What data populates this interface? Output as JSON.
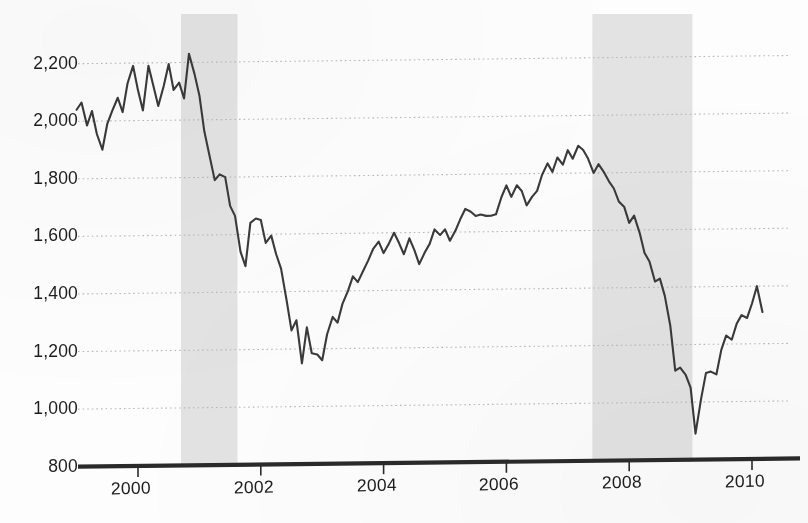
{
  "chart_data": {
    "type": "line",
    "title": "",
    "subtitle": "",
    "xlabel": "",
    "ylabel": "",
    "xlim": [
      1999.0,
      2010.3
    ],
    "ylim": [
      800,
      2300
    ],
    "grid": true,
    "grid_style": "dotted-horizontal",
    "legend": "none",
    "y_ticks": [
      800,
      1000,
      1200,
      1400,
      1600,
      1800,
      2000,
      2200
    ],
    "y_tick_labels": [
      "800",
      "1,000",
      "1,200",
      "1,400",
      "1,600",
      "1,800",
      "2,000",
      "2,200"
    ],
    "x_ticks": [
      2000,
      2002,
      2004,
      2006,
      2008,
      2010
    ],
    "x_tick_labels": [
      "2000",
      "2002",
      "2004",
      "2006",
      "2008",
      "2010"
    ],
    "colors": {
      "line": "#3a3a3a",
      "grid": "#b9b9b9",
      "axis": "#2a2a2a",
      "recession_band": "#e2e2e2",
      "background": "#fdfdfd",
      "text": "#1d1d1f"
    },
    "annotations": {
      "shaded_regions_label": "recession bands"
    },
    "shaded_regions": [
      {
        "name": "recession-band-2001",
        "x0": 2000.7,
        "x1": 2001.62
      },
      {
        "name": "recession-band-2008",
        "x0": 2007.4,
        "x1": 2009.03
      }
    ],
    "series": [
      {
        "name": "index-level",
        "x": [
          1999.0,
          1999.08,
          1999.17,
          1999.25,
          1999.33,
          1999.42,
          1999.5,
          1999.58,
          1999.67,
          1999.75,
          1999.83,
          1999.92,
          2000.0,
          2000.08,
          2000.17,
          2000.25,
          2000.33,
          2000.42,
          2000.5,
          2000.58,
          2000.67,
          2000.75,
          2000.83,
          2000.92,
          2001.0,
          2001.08,
          2001.17,
          2001.25,
          2001.33,
          2001.42,
          2001.5,
          2001.58,
          2001.67,
          2001.75,
          2001.83,
          2001.92,
          2002.0,
          2002.08,
          2002.17,
          2002.25,
          2002.33,
          2002.42,
          2002.5,
          2002.58,
          2002.67,
          2002.75,
          2002.83,
          2002.92,
          2003.0,
          2003.08,
          2003.17,
          2003.25,
          2003.33,
          2003.42,
          2003.5,
          2003.58,
          2003.67,
          2003.75,
          2003.83,
          2003.92,
          2004.0,
          2004.08,
          2004.17,
          2004.25,
          2004.33,
          2004.42,
          2004.5,
          2004.58,
          2004.67,
          2004.75,
          2004.83,
          2004.92,
          2005.0,
          2005.08,
          2005.17,
          2005.25,
          2005.33,
          2005.42,
          2005.5,
          2005.58,
          2005.67,
          2005.75,
          2005.83,
          2005.92,
          2006.0,
          2006.08,
          2006.17,
          2006.25,
          2006.33,
          2006.42,
          2006.5,
          2006.58,
          2006.67,
          2006.75,
          2006.83,
          2006.92,
          2007.0,
          2007.08,
          2007.17,
          2007.25,
          2007.33,
          2007.42,
          2007.5,
          2007.58,
          2007.67,
          2007.75,
          2007.83,
          2007.92,
          2008.0,
          2008.08,
          2008.17,
          2008.25,
          2008.33,
          2008.42,
          2008.5,
          2008.58,
          2008.67,
          2008.75,
          2008.83,
          2008.92,
          2009.0,
          2009.08,
          2009.17,
          2009.25,
          2009.33,
          2009.42,
          2009.5,
          2009.58,
          2009.67,
          2009.75,
          2009.83,
          2009.92,
          2010.0,
          2010.08,
          2010.17
        ],
        "values": [
          2040,
          2065,
          1985,
          2035,
          1955,
          1900,
          1990,
          2035,
          2080,
          2030,
          2130,
          2190,
          2105,
          2035,
          2190,
          2120,
          2050,
          2120,
          2195,
          2105,
          2130,
          2075,
          2230,
          2160,
          2085,
          1960,
          1870,
          1790,
          1810,
          1800,
          1700,
          1665,
          1540,
          1490,
          1640,
          1655,
          1650,
          1570,
          1595,
          1530,
          1480,
          1370,
          1265,
          1300,
          1150,
          1275,
          1185,
          1180,
          1160,
          1250,
          1310,
          1290,
          1355,
          1400,
          1450,
          1430,
          1470,
          1505,
          1545,
          1570,
          1530,
          1560,
          1600,
          1565,
          1525,
          1580,
          1540,
          1490,
          1530,
          1560,
          1610,
          1590,
          1610,
          1570,
          1605,
          1645,
          1680,
          1670,
          1655,
          1660,
          1655,
          1655,
          1660,
          1720,
          1760,
          1720,
          1760,
          1740,
          1690,
          1720,
          1740,
          1795,
          1835,
          1805,
          1855,
          1830,
          1880,
          1850,
          1895,
          1880,
          1850,
          1800,
          1830,
          1805,
          1770,
          1745,
          1700,
          1680,
          1625,
          1650,
          1590,
          1520,
          1490,
          1420,
          1430,
          1370,
          1265,
          1110,
          1120,
          1095,
          1050,
          890,
          1010,
          1100,
          1105,
          1095,
          1180,
          1230,
          1215,
          1270,
          1300,
          1290,
          1340,
          1400,
          1310
        ]
      }
    ]
  },
  "axes": {
    "y_label_texts": [
      "2,200",
      "2,000",
      "1,800",
      "1,600",
      "1,400",
      "1,200",
      "1,000",
      "800"
    ],
    "x_label_texts": [
      "2000",
      "2002",
      "2004",
      "2006",
      "2008",
      "2010"
    ]
  }
}
